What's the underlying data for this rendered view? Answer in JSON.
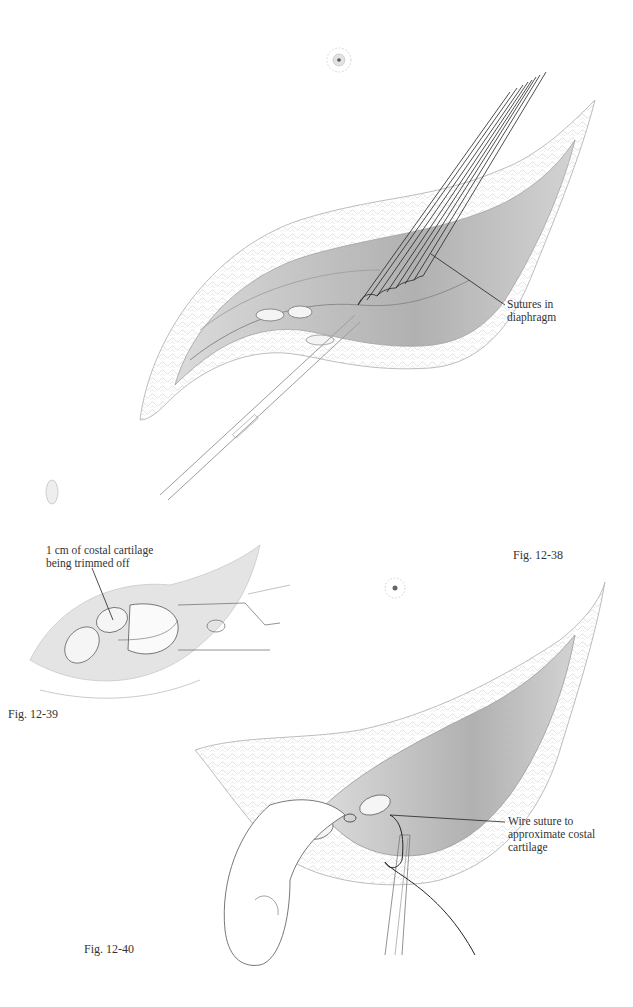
{
  "page": {
    "figures": [
      {
        "id": "fig-12-38",
        "caption": "Fig. 12-38",
        "labels": [
          {
            "line1": "Sutures in",
            "line2": "diaphragm"
          }
        ]
      },
      {
        "id": "fig-12-39",
        "caption": "Fig. 12-39",
        "labels": [
          {
            "line1": "1 cm of costal cartilage",
            "line2": "being trimmed off"
          }
        ]
      },
      {
        "id": "fig-12-40",
        "caption": "Fig. 12-40",
        "labels": [
          {
            "line1": "Wire suture to",
            "line2": "approximate costal",
            "line3": "cartilage"
          }
        ]
      }
    ]
  }
}
